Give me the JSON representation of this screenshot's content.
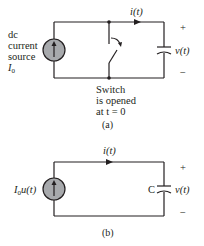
{
  "figure_a": {
    "source_label_lines": [
      "dc",
      "current",
      "source"
    ],
    "source_symbol": "I",
    "source_symbol_sub": "0",
    "current_label": "i(t)",
    "voltage_label": "v(t)",
    "plus": "+",
    "minus": "−",
    "switch_note_lines": [
      "Switch",
      "is opened",
      "at t = 0"
    ],
    "caption": "(a)"
  },
  "figure_b": {
    "source_symbol": "I",
    "source_symbol_sub": "0",
    "source_suffix": "u(t)",
    "current_label": "i(t)",
    "capacitor_label": "C",
    "voltage_label": "v(t)",
    "plus": "+",
    "minus": "−",
    "caption": "(b)"
  },
  "colors": {
    "wire": "#231f20",
    "source_fill": "#a7a9ac"
  }
}
